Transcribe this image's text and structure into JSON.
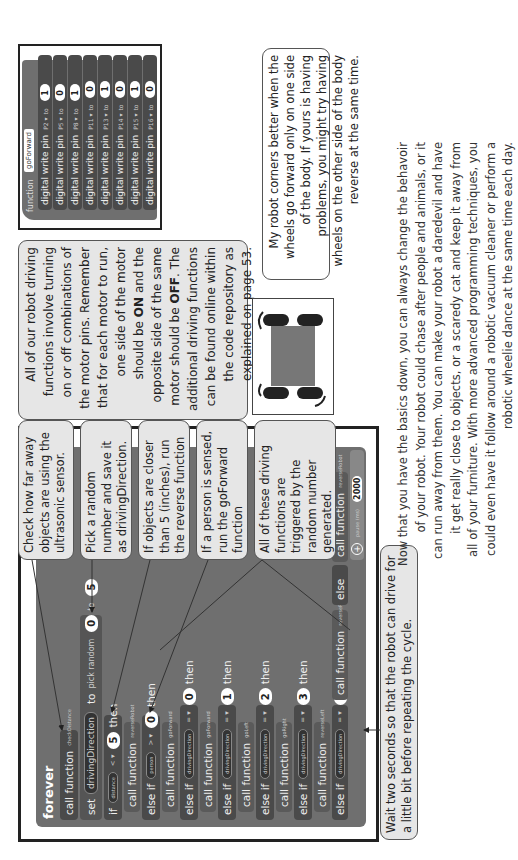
{
  "main_program": {
    "forever_label": "forever",
    "blocks": [
      {
        "keyword": "call function",
        "arg": "checkDistance"
      },
      {
        "keyword": "set",
        "variable": "drivingDirection",
        "to_label": "to",
        "random_label": "pick random",
        "from": "0",
        "to": "5"
      },
      {
        "keyword": "if",
        "pill": "distance",
        "operator": "< ▾",
        "value": "5",
        "then": "then"
      },
      {
        "keyword": "call function",
        "arg": "reverseRobot"
      },
      {
        "keyword": "else if",
        "pill": "person",
        "operator": "> ▾",
        "value": "0",
        "then": "then"
      },
      {
        "keyword": "call function",
        "arg": "goForward"
      },
      {
        "keyword": "else if",
        "pill": "drivingDirection",
        "operator": "= ▾",
        "value": "0",
        "then": "then"
      },
      {
        "keyword": "call function",
        "arg": "goForward"
      },
      {
        "keyword": "else if",
        "pill": "drivingDirection",
        "operator": "= ▾",
        "value": "1",
        "then": "then"
      },
      {
        "keyword": "call function",
        "arg": "goLeft"
      },
      {
        "keyword": "else if",
        "pill": "drivingDirection",
        "operator": "= ▾",
        "value": "2",
        "then": "then"
      },
      {
        "keyword": "call function",
        "arg": "goRight"
      },
      {
        "keyword": "else if",
        "pill": "drivingDirection",
        "operator": "= ▾",
        "value": "3",
        "then": "then"
      },
      {
        "keyword": "call function",
        "arg": "reverseLeft"
      },
      {
        "keyword": "else if",
        "pill": "drivingDirection",
        "operator": "= ▾",
        "value": "4",
        "then": "then"
      },
      {
        "keyword": "call function",
        "arg": "reverseRight"
      },
      {
        "keyword": "else"
      },
      {
        "keyword": "call function",
        "arg": "reverseRobot"
      },
      {
        "keyword": "pause (ms)",
        "value": "2000"
      }
    ],
    "add_icon": "plus-circle-icon"
  },
  "callouts": {
    "check_distance": "Check how far away objects are using the ultrasonic sensor.",
    "pick_random": "Pick a random number and save it as drivingDirection.",
    "objects_closer": "If objects are closer than 5 (inches), run the reverse function",
    "person_sensed": "If a person is sensed, run the goForward function",
    "driving_functions": "All of these driving functions are triggered by the random number generated.",
    "wait": "Wait two seconds so that the robot can drive for a little bit before repeating the cycle."
  },
  "motor_note": {
    "line1": "All of our robot driving functions involve turning on or off combinations of the motor pins. Remember that for each motor to run, one side of the motor should be",
    "on": "ON",
    "line2": "and the opposite side of the same motor should be",
    "off": "OFF",
    "line3": ". The additional driving functions can be found online within the code repository as explained on page 53."
  },
  "go_forward_function": {
    "function_label": "function",
    "name": "goForward",
    "rows": [
      {
        "label": "digital write pin",
        "pin": "P2 ▾",
        "to": "to",
        "value": "1"
      },
      {
        "label": "digital write pin",
        "pin": "P5 ▾",
        "to": "to",
        "value": "0"
      },
      {
        "label": "digital write pin",
        "pin": "P8 ▾",
        "to": "to",
        "value": "1"
      },
      {
        "label": "digital write pin",
        "pin": "P11 ▾",
        "to": "to",
        "value": "0"
      },
      {
        "label": "digital write pin",
        "pin": "P13 ▾",
        "to": "to",
        "value": "1"
      },
      {
        "label": "digital write pin",
        "pin": "P14 ▾",
        "to": "to",
        "value": "0"
      },
      {
        "label": "digital write pin",
        "pin": "P15 ▾",
        "to": "to",
        "value": "1"
      },
      {
        "label": "digital write pin",
        "pin": "P16 ▾",
        "to": "to",
        "value": "0"
      }
    ]
  },
  "tip_note": "My robot corners better when the wheels go forward only on one side of the body. If yours is having problems, you might try having wheels on the other side of the body reverse at the same time.",
  "body_paragraph": [
    "Now that you have the basics down, you can always change the behavoir",
    "of your robot.  Your robot could chase after people and animals, or it",
    "can run away from them. You can make your robot a daredevil and have",
    "it get really close to objects, or a scaredy cat and keep it away from",
    "all of your furniture. With more advanced programming techniques, you",
    "could even have it follow around a robotic vacuum cleaner or perform a",
    "robotic wheelie dance at the same time each day."
  ],
  "colors": {
    "block_dark": "#4a4a4a",
    "forever_bg": "#6f6f6f",
    "callout_bg": "#e6e6e6",
    "robot_body": "#777777",
    "robot_wheel": "#222222"
  }
}
